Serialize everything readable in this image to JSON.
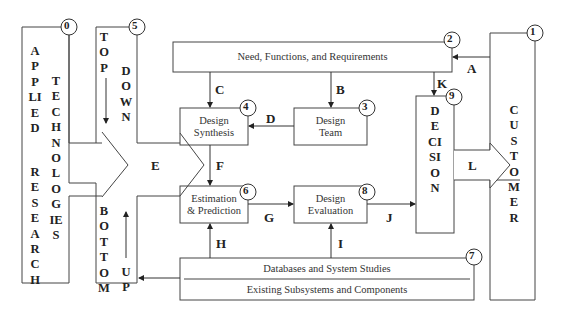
{
  "boxes": {
    "b0": {
      "num": "0",
      "col1": "APPLIED",
      "col2": "TECHNOLOGIES",
      "col1b": "RESEARCH"
    },
    "b1": {
      "num": "1",
      "label": "CUSTOMER"
    },
    "b2": {
      "num": "2",
      "label": "Need, Functions, and Requirements"
    },
    "b3": {
      "num": "3",
      "line1": "Design",
      "line2": "Team"
    },
    "b4": {
      "num": "4",
      "line1": "Design",
      "line2": "Synthesis"
    },
    "b5": {
      "num": "5",
      "top": "TOP",
      "down": "DOWN",
      "bottom": "BOTTOM",
      "up": "UP"
    },
    "b6": {
      "num": "6",
      "line1": "Estimation",
      "line2": "& Prediction"
    },
    "b7": {
      "num": "7",
      "line1": "Databases and System Studies",
      "line2": "Existing Subsystems and Components"
    },
    "b8": {
      "num": "8",
      "line1": "Design",
      "line2": "Evaluation"
    },
    "b9": {
      "num": "9",
      "label": "DECISION"
    }
  },
  "arrows": {
    "A": "A",
    "B": "B",
    "C": "C",
    "D": "D",
    "E": "E",
    "F": "F",
    "G": "G",
    "H": "H",
    "I": "I",
    "J": "J",
    "K": "K",
    "L": "L"
  }
}
